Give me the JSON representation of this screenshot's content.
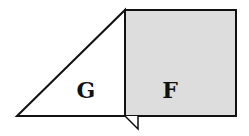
{
  "diagram": {
    "shapes": [
      {
        "id": "triangle",
        "label": "G",
        "fill": "#ffffff"
      },
      {
        "id": "square",
        "label": "F",
        "fill": "#dddddd"
      }
    ],
    "stroke_color": "#111111"
  }
}
